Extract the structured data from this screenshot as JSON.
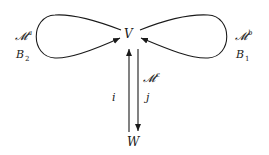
{
  "diagram": {
    "nodes": {
      "V": {
        "label": "V"
      },
      "W": {
        "label": "W"
      }
    },
    "loops": [
      {
        "id": "left-loop",
        "module": {
          "base": "𝓜",
          "sup": "a"
        },
        "map": {
          "base": "B",
          "sub": "2"
        }
      },
      {
        "id": "right-loop",
        "module": {
          "base": "𝓜",
          "sup": "b"
        },
        "map": {
          "base": "B",
          "sub": "1"
        }
      }
    ],
    "edges": [
      {
        "id": "i",
        "label": "i",
        "from": "W",
        "to": "V"
      },
      {
        "id": "j",
        "label": "j",
        "from": "V",
        "to": "W",
        "module": {
          "base": "𝓜",
          "sup": "c"
        }
      }
    ],
    "colors": {
      "stroke": "#1a1a1a",
      "background": "#ffffff"
    }
  }
}
